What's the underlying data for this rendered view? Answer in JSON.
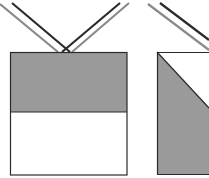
{
  "diagram": {
    "colors": {
      "background": "#ffffff",
      "fill_gray": "#9a9a9a",
      "stroke_dark": "#2a2a2a",
      "stroke_light": "#8a8a8a"
    },
    "left_box": {
      "x": 10,
      "y": 52,
      "width": 117,
      "height": 123,
      "split_y": 112
    },
    "right_box": {
      "x": 157,
      "y": 52,
      "diagonal_end": [
        209,
        112
      ]
    }
  }
}
